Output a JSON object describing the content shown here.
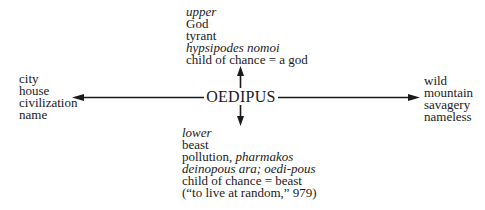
{
  "diagram": {
    "center": {
      "label": "OEDIPUS"
    },
    "top": {
      "lines": [
        {
          "text": "upper",
          "italic": true
        },
        {
          "text": "God",
          "italic": false
        },
        {
          "text": "tyrant",
          "italic": false
        },
        {
          "text": "hypsipodes nomoi",
          "italic": true
        },
        {
          "text": "child of chance = a god",
          "italic": false
        }
      ]
    },
    "bottom": {
      "lines": [
        {
          "text": "lower",
          "italic": true
        },
        {
          "text": "beast",
          "italic": false
        },
        {
          "segments": [
            {
              "text": "pollution, ",
              "italic": false
            },
            {
              "text": "pharmakos",
              "italic": true
            }
          ]
        },
        {
          "text": "deinopous ara; oedi-pous",
          "italic": true
        },
        {
          "text": "child of chance = beast",
          "italic": false
        },
        {
          "text": "(“to live at random,” 979)",
          "italic": false
        }
      ]
    },
    "left": {
      "lines": [
        {
          "text": "city"
        },
        {
          "text": "house"
        },
        {
          "text": "civilization"
        },
        {
          "text": "name"
        }
      ]
    },
    "right": {
      "lines": [
        {
          "text": "wild"
        },
        {
          "text": "mountain"
        },
        {
          "text": "savagery"
        },
        {
          "text": "nameless"
        }
      ]
    },
    "arrows": [
      {
        "direction": "up",
        "from": "center",
        "to": "top"
      },
      {
        "direction": "down",
        "from": "center",
        "to": "bottom"
      },
      {
        "direction": "left",
        "from": "center",
        "to": "left"
      },
      {
        "direction": "right",
        "from": "center",
        "to": "right"
      }
    ],
    "colors": {
      "ink": "#1a1a1a",
      "background": "#ffffff"
    }
  }
}
